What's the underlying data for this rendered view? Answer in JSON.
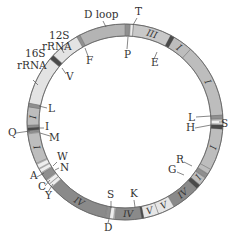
{
  "diagram": {
    "center": [
      125,
      122
    ],
    "outer_radius": 98,
    "inner_radius": 86,
    "colors": {
      "complex_I": "#bdbdbd",
      "complex_III": "#c8c8c8",
      "complex_IV": "#8a8a8a",
      "complex_V": "#e6e6e6",
      "rrna": "#e3e3e3",
      "dloop": "#b4b4b4",
      "trna_dark": "#4a4a4a",
      "trna_mid": "#8f8f8f",
      "trna_light": "#eeeeee",
      "outline": "#666666",
      "text": "#333333"
    },
    "segments": [
      {
        "start": 332,
        "end": 360,
        "fill": "dloop",
        "label": ""
      },
      {
        "start": 5,
        "end": 28,
        "fill": "complex_III",
        "label": "III"
      },
      {
        "start": 30,
        "end": 42,
        "fill": "complex_I",
        "label": "I"
      },
      {
        "start": 42,
        "end": 86,
        "fill": "complex_I",
        "label": "I"
      },
      {
        "start": 94,
        "end": 119,
        "fill": "complex_I",
        "label": "I"
      },
      {
        "start": 119,
        "end": 122,
        "fill": "complex_I",
        "label": ""
      },
      {
        "start": 125,
        "end": 130,
        "fill": "complex_I",
        "label": "I"
      },
      {
        "start": 133,
        "end": 150,
        "fill": "complex_IV",
        "label": "IV"
      },
      {
        "start": 150,
        "end": 160,
        "fill": "complex_V",
        "label": "V"
      },
      {
        "start": 160,
        "end": 169,
        "fill": "complex_V",
        "label": "V"
      },
      {
        "start": 170,
        "end": 186,
        "fill": "complex_IV",
        "label": "IV"
      },
      {
        "start": 192,
        "end": 228,
        "fill": "complex_IV",
        "label": "IV"
      },
      {
        "start": 245,
        "end": 263,
        "fill": "complex_I",
        "label": "I"
      },
      {
        "start": 268,
        "end": 279,
        "fill": "complex_I",
        "label": "I"
      },
      {
        "start": 281,
        "end": 310,
        "fill": "rrna",
        "label": ""
      },
      {
        "start": 313,
        "end": 331,
        "fill": "rrna",
        "label": ""
      }
    ],
    "trnas": [
      {
        "angle": 1.5,
        "width": 2.5,
        "fill": "trna_mid"
      },
      {
        "angle": 4,
        "width": 1.6,
        "fill": "trna_light"
      },
      {
        "angle": 29,
        "width": 2.4,
        "fill": "trna_dark"
      },
      {
        "angle": 87,
        "width": 2.2,
        "fill": "trna_mid"
      },
      {
        "angle": 90,
        "width": 2.2,
        "fill": "trna_light"
      },
      {
        "angle": 93,
        "width": 2.4,
        "fill": "trna_dark"
      },
      {
        "angle": 123.5,
        "width": 2.4,
        "fill": "trna_mid"
      },
      {
        "angle": 131.5,
        "width": 2.6,
        "fill": "trna_dark"
      },
      {
        "angle": 169.5,
        "width": 1.2,
        "fill": "trna_dark"
      },
      {
        "angle": 188,
        "width": 2.4,
        "fill": "trna_light"
      },
      {
        "angle": 190.5,
        "width": 2.4,
        "fill": "trna_mid"
      },
      {
        "angle": 229.5,
        "width": 2.2,
        "fill": "trna_light"
      },
      {
        "angle": 232,
        "width": 2.4,
        "fill": "trna_light"
      },
      {
        "angle": 236,
        "width": 4.5,
        "fill": "trna_mid"
      },
      {
        "angle": 240,
        "width": 2.2,
        "fill": "trna_light"
      },
      {
        "angle": 243,
        "width": 2.6,
        "fill": "trna_light"
      },
      {
        "angle": 264.3,
        "width": 1.6,
        "fill": "trna_mid"
      },
      {
        "angle": 265.8,
        "width": 1.6,
        "fill": "trna_dark"
      },
      {
        "angle": 267.3,
        "width": 1.4,
        "fill": "trna_mid"
      },
      {
        "angle": 280,
        "width": 2.2,
        "fill": "trna_mid"
      },
      {
        "angle": 311.5,
        "width": 2.6,
        "fill": "trna_dark"
      },
      {
        "angle": 331.5,
        "width": 2.2,
        "fill": "trna_mid"
      }
    ],
    "inner_labels": [
      {
        "text": "III",
        "angle": 17
      },
      {
        "text": "I",
        "angle": 36
      },
      {
        "text": "I",
        "angle": 64
      },
      {
        "text": "I",
        "angle": 106
      },
      {
        "text": "I",
        "angle": 127
      },
      {
        "text": "IV",
        "angle": 141
      },
      {
        "text": "V",
        "angle": 155
      },
      {
        "text": "V",
        "angle": 164.5
      },
      {
        "text": "IV",
        "angle": 178
      },
      {
        "text": "IV",
        "angle": 210
      },
      {
        "text": "I",
        "angle": 254
      },
      {
        "text": "I",
        "angle": 273
      }
    ],
    "outer_labels": [
      {
        "text": "D loop",
        "x": 84,
        "y": 18,
        "lx1": 103,
        "ly1": 21,
        "lx2": 106,
        "ly2": 27
      },
      {
        "text": "12S",
        "x": 49,
        "y": 39,
        "lx1": 61,
        "ly1": 48,
        "lx2": 64,
        "ly2": 53
      },
      {
        "text": "rRNA",
        "x": 42,
        "y": 50,
        "lx1": 0,
        "ly1": 0,
        "lx2": 0,
        "ly2": 0
      },
      {
        "text": "16S",
        "x": 25,
        "y": 57,
        "lx1": 33,
        "ly1": 80,
        "lx2": 38,
        "ly2": 85
      },
      {
        "text": "rRNA",
        "x": 17,
        "y": 69,
        "lx1": 0,
        "ly1": 0,
        "lx2": 0,
        "ly2": 0
      },
      {
        "text": "T",
        "x": 135,
        "y": 15,
        "lx1": 137,
        "ly1": 18,
        "lx2": 133,
        "ly2": 25
      },
      {
        "text": "P",
        "x": 124,
        "y": 58,
        "lx1": 127,
        "ly1": 49,
        "lx2": 128,
        "ly2": 37
      },
      {
        "text": "E",
        "x": 151,
        "y": 66,
        "lx1": 154,
        "ly1": 59,
        "lx2": 157,
        "ly2": 52
      },
      {
        "text": "F",
        "x": 86,
        "y": 64,
        "lx1": 88,
        "ly1": 56,
        "lx2": 85,
        "ly2": 48
      },
      {
        "text": "V",
        "x": 66,
        "y": 80,
        "lx1": 66,
        "ly1": 74,
        "lx2": 62,
        "ly2": 68
      },
      {
        "text": "L",
        "x": 48,
        "y": 112,
        "lx1": 47,
        "ly1": 108,
        "lx2": 39,
        "ly2": 106
      },
      {
        "text": "I",
        "x": 45,
        "y": 130,
        "lx1": 44,
        "ly1": 128,
        "lx2": 38,
        "ly2": 128
      },
      {
        "text": "Q",
        "x": 8,
        "y": 136,
        "lx1": 16,
        "ly1": 133,
        "lx2": 30,
        "ly2": 131
      },
      {
        "text": "M",
        "x": 49,
        "y": 141,
        "lx1": 50,
        "ly1": 136,
        "lx2": 40,
        "ly2": 133
      },
      {
        "text": "W",
        "x": 57,
        "y": 160,
        "lx1": 57,
        "ly1": 162,
        "lx2": 53,
        "ly2": 166
      },
      {
        "text": "N",
        "x": 60,
        "y": 171,
        "lx1": 59,
        "ly1": 168,
        "lx2": 55,
        "ly2": 170
      },
      {
        "text": "A",
        "x": 30,
        "y": 179,
        "lx1": 37,
        "ly1": 177,
        "lx2": 44,
        "ly2": 173
      },
      {
        "text": "C",
        "x": 38,
        "y": 190,
        "lx1": 45,
        "ly1": 186,
        "lx2": 50,
        "ly2": 180
      },
      {
        "text": "Y",
        "x": 45,
        "y": 199,
        "lx1": 48,
        "ly1": 192,
        "lx2": 53,
        "ly2": 184
      },
      {
        "text": "S",
        "x": 107,
        "y": 198,
        "lx1": 111,
        "ly1": 201,
        "lx2": 111,
        "ly2": 208
      },
      {
        "text": "D",
        "x": 104,
        "y": 231,
        "lx1": 108,
        "ly1": 223,
        "lx2": 109,
        "ly2": 219
      },
      {
        "text": "K",
        "x": 130,
        "y": 197,
        "lx1": 134,
        "ly1": 200,
        "lx2": 135,
        "ly2": 207
      },
      {
        "text": "G",
        "x": 168,
        "y": 173,
        "lx1": 177,
        "ly1": 172,
        "lx2": 184,
        "ly2": 175
      },
      {
        "text": "R",
        "x": 176,
        "y": 163,
        "lx1": 184,
        "ly1": 162,
        "lx2": 192,
        "ly2": 166
      },
      {
        "text": "L",
        "x": 188,
        "y": 121,
        "lx1": 196,
        "ly1": 117,
        "lx2": 211,
        "ly2": 116
      },
      {
        "text": "S",
        "x": 221,
        "y": 127,
        "lx1": 219,
        "ly1": 122,
        "lx2": 224,
        "ly2": 122
      },
      {
        "text": "H",
        "x": 186,
        "y": 131,
        "lx1": 195,
        "ly1": 128,
        "lx2": 211,
        "ly2": 125
      }
    ]
  }
}
